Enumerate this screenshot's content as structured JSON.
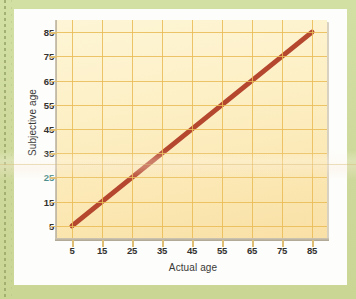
{
  "figure": {
    "background_color": "#cfdd9e",
    "card_color": "#fdfdfb"
  },
  "chart_data": {
    "type": "line",
    "title": "",
    "xlabel": "Actual age",
    "ylabel": "Subjective age",
    "xlim": [
      0,
      90
    ],
    "ylim": [
      0,
      90
    ],
    "xticks": [
      5,
      15,
      25,
      35,
      45,
      55,
      65,
      75,
      85
    ],
    "xticklabels": [
      "5",
      "15",
      "25",
      "35",
      "45",
      "55",
      "65",
      "75",
      "85"
    ],
    "yticks": [
      5,
      15,
      25,
      35,
      45,
      55,
      65,
      75,
      85
    ],
    "yticklabels": [
      "5",
      "15",
      "25",
      "35",
      "45",
      "55",
      "65",
      "75",
      "85"
    ],
    "grid": true,
    "grid_color": "#e9bb55",
    "legend": "none",
    "plot_bgcolor": "#fdf0c6",
    "series": [
      {
        "name": "Subjective age vs actual age",
        "color": "#b5472f",
        "linewidth": 5,
        "x": [
          5,
          15,
          25,
          35,
          45,
          55,
          65,
          75,
          85
        ],
        "y": [
          5,
          15,
          25,
          35,
          45,
          55,
          65,
          75,
          85
        ]
      }
    ],
    "tinted_ytick_label": "25",
    "tinted_ytick_color": "#4e8f8c"
  }
}
